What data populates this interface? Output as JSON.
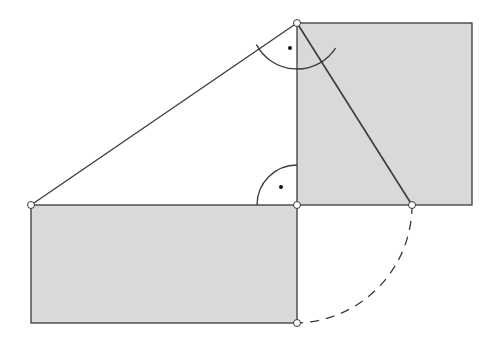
{
  "canvas": {
    "width": 498,
    "height": 339,
    "background": "#ffffff"
  },
  "colors": {
    "fill": "#d9d9d9",
    "stroke": "#3a3a3a",
    "point_fill": "#ffffff",
    "dot": "#111111"
  },
  "points": {
    "A": {
      "x": 31,
      "y": 205
    },
    "B": {
      "x": 297,
      "y": 205
    },
    "C": {
      "x": 297,
      "y": 23
    },
    "D": {
      "x": 412,
      "y": 205
    },
    "E": {
      "x": 297,
      "y": 323
    }
  },
  "shapes": {
    "square": {
      "x": 297,
      "y": 23,
      "w": 175,
      "h": 182
    },
    "rectangle": {
      "x": 31,
      "y": 205,
      "w": 266,
      "h": 118
    }
  },
  "segments": [
    {
      "name": "hypotenuse-ac",
      "from": "A",
      "to": "C"
    },
    {
      "name": "segment-cd",
      "from": "C",
      "to": "D"
    }
  ],
  "angle_marks": [
    {
      "name": "right-angle-c",
      "cx": 297,
      "cy": 23,
      "r": 46,
      "start_deg": 33,
      "end_deg": 152,
      "dot": {
        "x": 290,
        "y": 48
      }
    },
    {
      "name": "right-angle-b",
      "cx": 297,
      "cy": 205,
      "r": 40,
      "start_deg": 180,
      "end_deg": 270,
      "dot": {
        "x": 281,
        "y": 187
      }
    }
  ],
  "dashed_arc": {
    "name": "arc-d-to-e",
    "cx": 297,
    "cy": 205,
    "r": 118,
    "from": "D",
    "to": "E"
  }
}
